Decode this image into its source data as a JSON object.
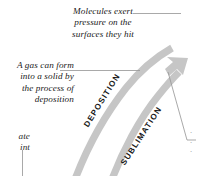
{
  "figure": {
    "colors": {
      "arrow_gray": "#c6c6c6",
      "leader_line": "#9a9a9a",
      "text": "#1a1a1a",
      "faint_text": "#8a8a8a",
      "background": "#ffffff"
    },
    "callouts": [
      {
        "id": "molecules",
        "text": "Molecules exert\npressure on the\nsurfaces they hit",
        "leader": "horizontal line to the right"
      },
      {
        "id": "deposition-note",
        "text": "A gas can form\ninto a solid by\nthe process of\ndeposition",
        "leader": "horizontal line to the right"
      },
      {
        "id": "bottom-left-cropped",
        "text": "ate\nint",
        "leader": "vertical line below"
      },
      {
        "id": "right-edge-cropped",
        "text": "·\n·\n·",
        "leader": "bent line to the sublimation arrow"
      }
    ],
    "band_labels": [
      {
        "id": "deposition",
        "text": "DEPOSITION"
      },
      {
        "id": "sublimation",
        "text": "SUBLIMATION"
      }
    ]
  }
}
